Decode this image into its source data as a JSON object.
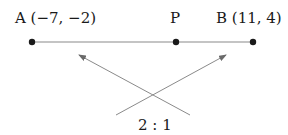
{
  "diagram": {
    "points": [
      {
        "id": "A",
        "label": "A (−7, −2)",
        "x": 32,
        "y": 42
      },
      {
        "id": "P",
        "label": "P",
        "x": 176,
        "y": 42
      },
      {
        "id": "B",
        "label": "B (11, 4)",
        "x": 253,
        "y": 42
      }
    ],
    "ratio_label": "2 : 1",
    "colors": {
      "line": "#8a8a8a",
      "dot": "#1a1a1a",
      "text": "#1a1a1a"
    }
  }
}
